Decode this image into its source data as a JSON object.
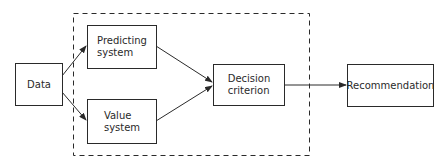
{
  "diagram": {
    "type": "flowchart",
    "colors": {
      "line": "#2a2a2a",
      "background": "#ffffff"
    },
    "nodes": {
      "data": {
        "label": "Data"
      },
      "predicting": {
        "label": "Predicting\nsystem"
      },
      "value": {
        "label": "Value\nsystem"
      },
      "decision": {
        "label": "Decision\ncriterion"
      },
      "recommendation": {
        "label": "Recommendation"
      }
    },
    "edges": [
      {
        "from": "Data",
        "to": "Predicting system"
      },
      {
        "from": "Data",
        "to": "Value system"
      },
      {
        "from": "Predicting system",
        "to": "Decision criterion"
      },
      {
        "from": "Value system",
        "to": "Decision criterion"
      },
      {
        "from": "Decision criterion",
        "to": "Recommendation"
      }
    ],
    "group": {
      "style": "dashed",
      "contains": [
        "Predicting system",
        "Value system",
        "Decision criterion"
      ]
    }
  }
}
